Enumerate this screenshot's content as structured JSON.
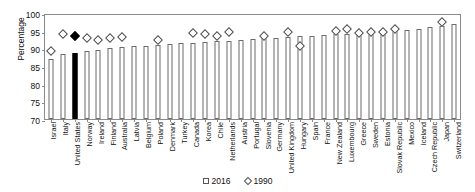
{
  "chart_data": {
    "type": "bar",
    "title": "",
    "xlabel": "",
    "ylabel": "Percentage",
    "ylim": [
      70,
      100
    ],
    "yticks": [
      70,
      75,
      80,
      85,
      90,
      95,
      100
    ],
    "grid": false,
    "legend_position": "bottom",
    "categories": [
      "Israel",
      "Italy",
      "United States",
      "Norway",
      "Ireland",
      "Finland",
      "Australia",
      "Latvia",
      "Belgium",
      "Poland",
      "Denmark",
      "Turkey",
      "Canada",
      "Korea",
      "Chile",
      "Netherlands",
      "Austria",
      "Portugal",
      "Slovenia",
      "Germany",
      "United Kingdom",
      "Hungary",
      "Spain",
      "France",
      "New Zealand",
      "Luxembourg",
      "Greece",
      "Sweden",
      "Estonia",
      "Slovak Republic",
      "Mexico",
      "Iceland",
      "Czech Republic",
      "Japan",
      "Switzerland"
    ],
    "series": [
      {
        "name": "2016",
        "marker": "bar",
        "values": [
          87.0,
          88.5,
          88.6,
          89.2,
          89.4,
          90.0,
          90.3,
          90.6,
          90.8,
          91.0,
          91.2,
          91.4,
          91.6,
          91.8,
          92.0,
          92.2,
          92.4,
          92.6,
          92.8,
          93.0,
          93.2,
          93.4,
          93.6,
          93.8,
          94.0,
          94.2,
          94.4,
          94.6,
          94.8,
          95.0,
          95.2,
          95.6,
          96.0,
          96.4,
          96.8
        ]
      },
      {
        "name": "1990",
        "marker": "diamond",
        "values": [
          89.3,
          94.0,
          93.5,
          92.8,
          92.5,
          93.0,
          93.2,
          null,
          null,
          92.3,
          null,
          null,
          94.3,
          94.0,
          93.6,
          94.5,
          null,
          null,
          93.5,
          null,
          94.5,
          90.8,
          null,
          null,
          94.9,
          95.4,
          94.4,
          94.6,
          94.6,
          95.6,
          null,
          null,
          null,
          97.5,
          null
        ]
      }
    ],
    "highlight": {
      "category": "United States",
      "color": "#000000"
    }
  },
  "legend": {
    "items": [
      {
        "label": "2016",
        "marker": "square"
      },
      {
        "label": "1990",
        "marker": "diamond"
      }
    ]
  }
}
